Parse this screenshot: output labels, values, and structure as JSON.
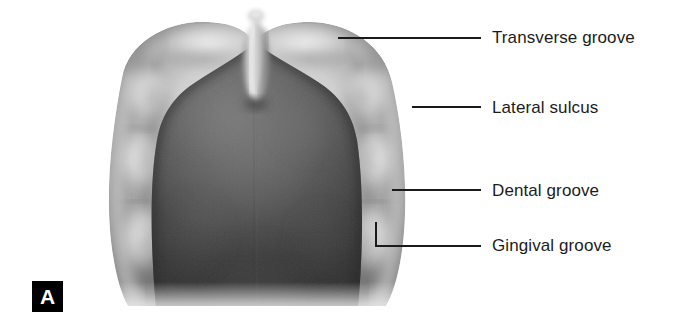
{
  "figure": {
    "panel_label": "A",
    "palette": {
      "background": "#ffffff",
      "ridge_light": "#f2f2f2",
      "ridge_mid": "#b4b4b4",
      "ridge_shadow": "#6e6e6e",
      "palate_dark": "#3b3b3b",
      "palate_mid": "#555555",
      "leader_line": "#1a1a1a",
      "label_text": "#1c1c1c",
      "badge_background": "#000000",
      "badge_text": "#ffffff"
    }
  },
  "callouts": [
    {
      "id": "transverse-groove",
      "label": "Transverse groove",
      "text_x": 492,
      "text_y": 28,
      "line": {
        "x1": 338,
        "y1": 38,
        "x2": 481,
        "y2": 38
      },
      "elbow": null
    },
    {
      "id": "lateral-sulcus",
      "label": "Lateral sulcus",
      "text_x": 492,
      "text_y": 98,
      "line": {
        "x1": 412,
        "y1": 107,
        "x2": 481,
        "y2": 107
      },
      "elbow": null
    },
    {
      "id": "dental-groove",
      "label": "Dental groove",
      "text_x": 492,
      "text_y": 181,
      "line": {
        "x1": 392,
        "y1": 190,
        "x2": 481,
        "y2": 190
      },
      "elbow": null
    },
    {
      "id": "gingival-groove",
      "label": "Gingival groove",
      "text_x": 492,
      "text_y": 236,
      "line": {
        "x1": 376,
        "y1": 246,
        "x2": 481,
        "y2": 246
      },
      "elbow": {
        "x": 376,
        "y_top": 222,
        "y_bottom": 246
      }
    }
  ]
}
